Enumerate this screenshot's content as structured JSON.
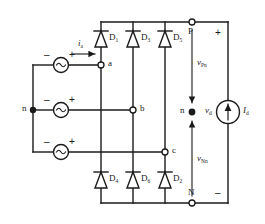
{
  "figure": {
    "type": "three-phase-full-bridge-diode-rectifier",
    "line_color": "#1a1a1a"
  },
  "sources": {
    "phase_a": {
      "minus": "–",
      "plus": "+"
    },
    "phase_b": {
      "minus": "–",
      "plus": "+"
    },
    "phase_c": {
      "minus": "–",
      "plus": "+"
    }
  },
  "currents": {
    "ia": "i",
    "ia_sub": "a",
    "id": "I",
    "id_sub": "d"
  },
  "nodes": {
    "neutral_left": "n",
    "a": "a",
    "b": "b",
    "c": "c",
    "neutral_right": "n",
    "p": "P",
    "n": "N"
  },
  "diodes": {
    "top": [
      {
        "label": "D",
        "sub": "1"
      },
      {
        "label": "D",
        "sub": "3"
      },
      {
        "label": "D",
        "sub": "5"
      }
    ],
    "bottom": [
      {
        "label": "D",
        "sub": "4"
      },
      {
        "label": "D",
        "sub": "6"
      },
      {
        "label": "D",
        "sub": "2"
      }
    ]
  },
  "voltages": {
    "vpn": "v",
    "vpn_sub": "Pn",
    "vnn": "v",
    "vnn_sub": "Nn",
    "vd": "v",
    "vd_sub": "d",
    "out_plus": "+",
    "out_minus": "–"
  }
}
